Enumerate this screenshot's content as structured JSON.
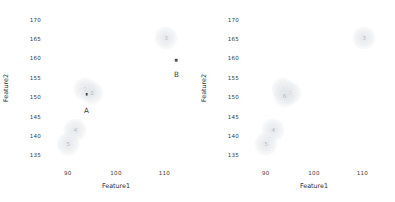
{
  "figure": {
    "width": 395,
    "height": 202,
    "background": "#ffffff",
    "panels": [
      "left",
      "right"
    ]
  },
  "chart_data": [
    {
      "type": "scatter",
      "panel": "left",
      "title": "",
      "xlabel": "Feature1",
      "ylabel": "Feature2",
      "xlim": [
        85.5,
        114.5
      ],
      "ylim": [
        132.5,
        172.0
      ],
      "xticks": [
        "90",
        "100",
        "110"
      ],
      "xtick_values": [
        90,
        100,
        110
      ],
      "yticks": [
        "135",
        "140",
        "145",
        "150",
        "155",
        "160",
        "165",
        "170"
      ],
      "ytick_values": [
        135,
        140,
        145,
        150,
        155,
        160,
        165,
        170
      ],
      "grid": false,
      "legend": false,
      "marker_color": "#e3e6e9",
      "label_color": "#b9bcc0",
      "annotation_color": "#3c3c3c",
      "points": [
        {
          "label": "1",
          "x": 93.6,
          "y": 152.2,
          "size": 23
        },
        {
          "label": "2",
          "x": 95.0,
          "y": 151.1,
          "size": 23
        },
        {
          "label": "3",
          "x": 110.4,
          "y": 165.4,
          "size": 23
        },
        {
          "label": "4",
          "x": 91.6,
          "y": 141.6,
          "size": 23
        },
        {
          "label": "5",
          "x": 90.1,
          "y": 137.9,
          "size": 23
        }
      ],
      "annotations": [
        {
          "label": "A",
          "x": 93.9,
          "y": 150.8,
          "label_offset_y": -4.0
        },
        {
          "label": "B",
          "x": 112.5,
          "y": 159.5,
          "label_offset_y": -3.4
        }
      ]
    },
    {
      "type": "scatter",
      "panel": "right",
      "title": "",
      "xlabel": "Feature1",
      "ylabel": "Feature2",
      "xlim": [
        85.5,
        114.5
      ],
      "ylim": [
        132.5,
        172.0
      ],
      "xticks": [
        "90",
        "100",
        "110"
      ],
      "xtick_values": [
        90,
        100,
        110
      ],
      "yticks": [
        "135",
        "140",
        "145",
        "150",
        "155",
        "160",
        "165",
        "170"
      ],
      "ytick_values": [
        135,
        140,
        145,
        150,
        155,
        160,
        165,
        170
      ],
      "grid": false,
      "legend": false,
      "marker_color": "#e3e6e9",
      "label_color": "#b9bcc0",
      "annotation_color": "#3c3c3c",
      "points": [
        {
          "label": "1",
          "x": 93.6,
          "y": 152.2,
          "size": 23
        },
        {
          "label": "2",
          "x": 95.0,
          "y": 151.1,
          "size": 23
        },
        {
          "label": "3",
          "x": 110.4,
          "y": 165.4,
          "size": 23
        },
        {
          "label": "4",
          "x": 91.6,
          "y": 141.6,
          "size": 23
        },
        {
          "label": "5",
          "x": 90.1,
          "y": 137.9,
          "size": 23
        },
        {
          "label": "6",
          "x": 93.9,
          "y": 150.4,
          "size": 23
        }
      ],
      "annotations": []
    }
  ]
}
